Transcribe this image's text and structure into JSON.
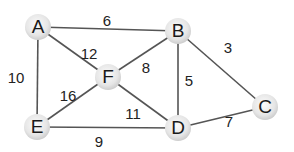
{
  "graph": {
    "type": "weighted-undirected-graph",
    "nodes": [
      {
        "id": "A",
        "label": "A",
        "x": 38,
        "y": 27
      },
      {
        "id": "B",
        "label": "B",
        "x": 178,
        "y": 31
      },
      {
        "id": "C",
        "label": "C",
        "x": 265,
        "y": 107
      },
      {
        "id": "D",
        "label": "D",
        "x": 178,
        "y": 128
      },
      {
        "id": "E",
        "label": "E",
        "x": 37,
        "y": 127
      },
      {
        "id": "F",
        "label": "F",
        "x": 108,
        "y": 77
      }
    ],
    "edges": [
      {
        "from": "A",
        "to": "B",
        "weight": "6",
        "lx": 107,
        "ly": 22
      },
      {
        "from": "A",
        "to": "F",
        "weight": "12",
        "lx": 89,
        "ly": 55
      },
      {
        "from": "A",
        "to": "E",
        "weight": "10",
        "lx": 16,
        "ly": 79
      },
      {
        "from": "B",
        "to": "F",
        "weight": "8",
        "lx": 146,
        "ly": 69
      },
      {
        "from": "B",
        "to": "D",
        "weight": "5",
        "lx": 189,
        "ly": 82
      },
      {
        "from": "B",
        "to": "C",
        "weight": "3",
        "lx": 228,
        "ly": 49
      },
      {
        "from": "F",
        "to": "E",
        "weight": "16",
        "lx": 68,
        "ly": 97
      },
      {
        "from": "F",
        "to": "D",
        "weight": "11",
        "lx": 133,
        "ly": 115
      },
      {
        "from": "E",
        "to": "D",
        "weight": "9",
        "lx": 99,
        "ly": 143
      },
      {
        "from": "D",
        "to": "C",
        "weight": "7",
        "lx": 229,
        "ly": 123
      }
    ],
    "style": {
      "node_radius": 13,
      "node_fill_light": "#f4f4f4",
      "node_fill_dark": "#cfcfcf",
      "edge_color": "#555555",
      "text_color": "#222222"
    }
  }
}
